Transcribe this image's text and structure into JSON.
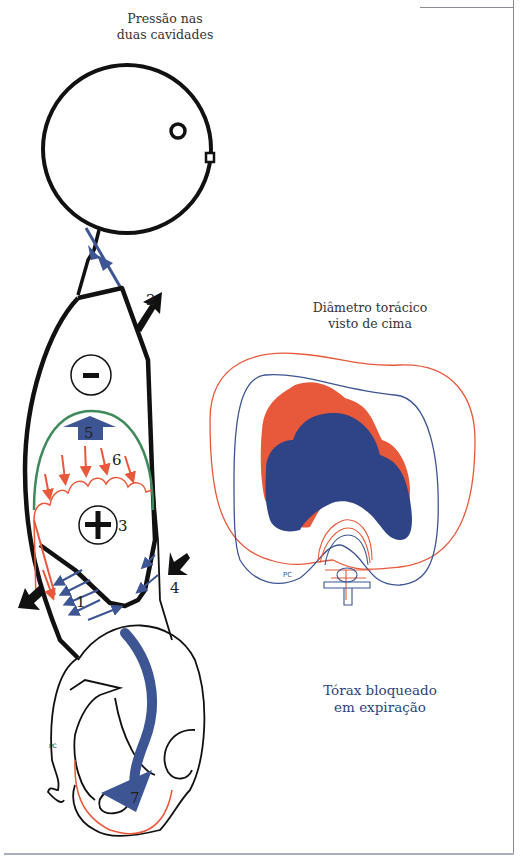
{
  "captions": {
    "top_line1": "Pressão nas",
    "top_line2": "duas cavidades",
    "middle_line1": "Diâmetro torácico",
    "middle_line2": "visto de cima",
    "bottom_line1": "Tórax bloqueado",
    "bottom_line2": "em expiração"
  },
  "labels": {
    "n1": "1",
    "n2": "2",
    "n3": "3",
    "n4": "4",
    "n5": "5",
    "n6": "6",
    "n7": "7",
    "pc_side": "PC",
    "pc_top": "PC",
    "minus_sign": "−",
    "plus_sign": "+"
  },
  "colors": {
    "outline": "#111111",
    "blue": "#3d5593",
    "blue_dark": "#2e4487",
    "orange": "#e8583a",
    "green": "#3f8a5a",
    "caption_blue": "#2e3f7a"
  }
}
